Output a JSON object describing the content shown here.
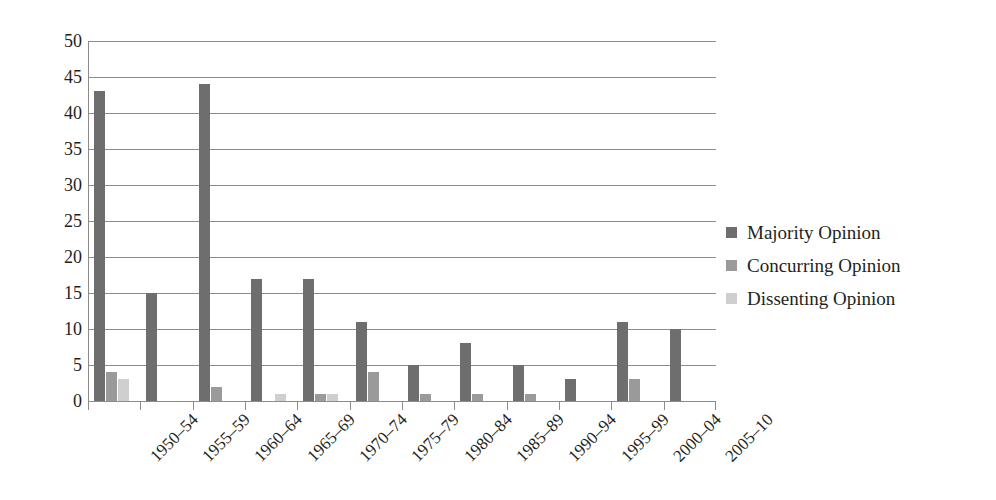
{
  "chart_data": {
    "type": "bar",
    "title": "",
    "xlabel": "",
    "ylabel": "",
    "ylim": [
      0,
      50
    ],
    "yticks": [
      50,
      45,
      40,
      35,
      30,
      25,
      20,
      15,
      10,
      5,
      0
    ],
    "grid": true,
    "legend_position": "right",
    "categories": [
      "1950–54",
      "1955–59",
      "1960–64",
      "1965–69",
      "1970–74",
      "1975–79",
      "1980–84",
      "1985–89",
      "1990–94",
      "1995–99",
      "2000–04",
      "2005–10"
    ],
    "series": [
      {
        "name": "Majority Opinion",
        "color": "#6e6e6e",
        "values": [
          43,
          15,
          44,
          17,
          17,
          11,
          5,
          8,
          5,
          3,
          11,
          10
        ]
      },
      {
        "name": "Concurring Opinion",
        "color": "#9a9a9a",
        "values": [
          4,
          0,
          2,
          0,
          1,
          4,
          1,
          1,
          1,
          0,
          3,
          0
        ]
      },
      {
        "name": "Dissenting Opinion",
        "color": "#cfcfcf",
        "values": [
          3,
          0,
          0,
          1,
          1,
          0,
          0,
          0,
          0,
          0,
          0,
          0
        ]
      }
    ]
  }
}
